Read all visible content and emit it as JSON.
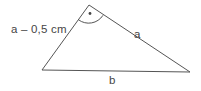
{
  "figure": {
    "kind": "geometry-diagram",
    "shape": "triangle",
    "background_color": "#ffffff",
    "line_color": "#555555",
    "text_color": "#454545",
    "labels": {
      "left_side": "a – 0,5 cm",
      "right_side": "a",
      "bottom_side": "b"
    },
    "angle_marker": {
      "vertex": "apex",
      "style": "arc-with-center-dot",
      "dot_color": "#444444"
    },
    "geometry": {
      "apex": [
        89,
        5
      ],
      "left_vertex": [
        42,
        70
      ],
      "right_vertex": [
        190,
        72
      ]
    }
  }
}
